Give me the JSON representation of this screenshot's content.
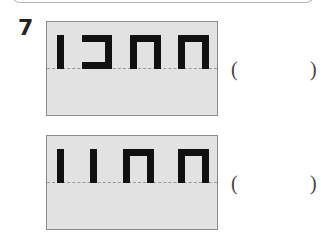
{
  "question": {
    "number": "7"
  },
  "items": [
    {
      "glyphs": [
        "bar",
        "right-bracket",
        "arch",
        "arch"
      ],
      "answer_open": "(",
      "answer_close": ")",
      "answer_value": ""
    },
    {
      "glyphs": [
        "bar",
        "bar",
        "arch",
        "arch"
      ],
      "answer_open": "(",
      "answer_close": ")",
      "answer_value": ""
    }
  ],
  "colors": {
    "card_bg": "#e2e2e2",
    "card_border": "#8c8c8c",
    "glyph": "#111111",
    "baseline": "#9a9a9a"
  }
}
